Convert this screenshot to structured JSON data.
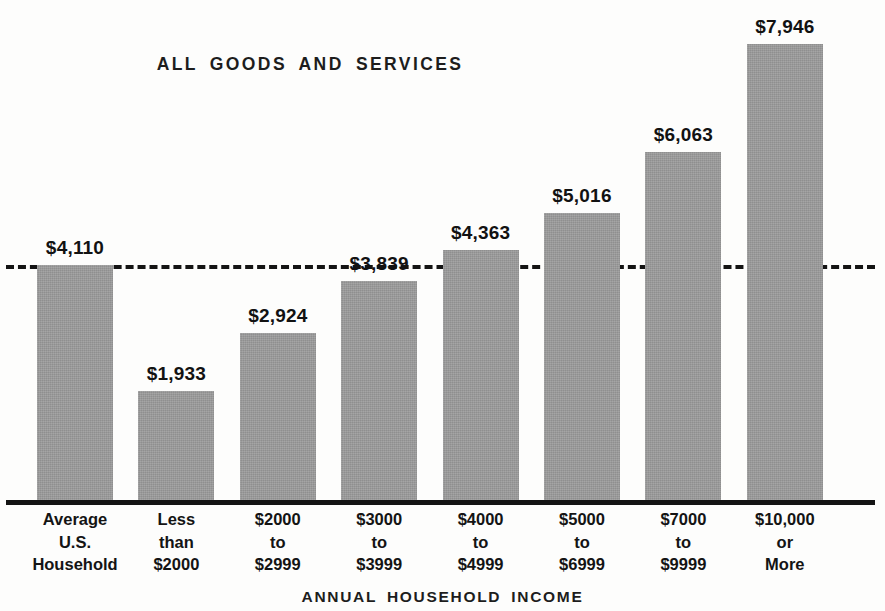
{
  "chart_data": {
    "type": "bar",
    "title": "ALL GOODS AND SERVICES",
    "xlabel": "ANNUAL HOUSEHOLD INCOME",
    "ylabel": "",
    "ylim": [
      0,
      8600
    ],
    "grid": false,
    "legend": null,
    "value_prefix": "$",
    "categories": [
      "Average U.S. Household",
      "Less than $2000",
      "$2000 to $2999",
      "$3000 to $3999",
      "$4000 to $4999",
      "$5000 to $6999",
      "$7000 to $9999",
      "$10,000 or More"
    ],
    "category_lines": [
      [
        "Average",
        "U.S.",
        "Household"
      ],
      [
        "Less",
        "than",
        "$2000"
      ],
      [
        "$2000",
        "to",
        "$2999"
      ],
      [
        "$3000",
        "to",
        "$3999"
      ],
      [
        "$4000",
        "to",
        "$4999"
      ],
      [
        "$5000",
        "to",
        "$6999"
      ],
      [
        "$7000",
        "to",
        "$9999"
      ],
      [
        "$10,000",
        "or",
        "More"
      ]
    ],
    "values": [
      4110,
      1933,
      2924,
      3839,
      4363,
      5016,
      6063,
      7946
    ],
    "value_labels": [
      "$4,110",
      "$1,933",
      "$2,924",
      "$3,839",
      "$4,363",
      "$5,016",
      "$6,063",
      "$7,946"
    ],
    "reference_line": {
      "value": 4110,
      "label": "$4,110",
      "style": "dashed",
      "description": "Average U.S. Household reference level"
    },
    "colors": {
      "bar_fill": "#9b9b9b",
      "axis": "#141414",
      "text": "#141414",
      "background": "#fdfdfc"
    }
  }
}
